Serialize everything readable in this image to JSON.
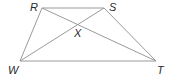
{
  "diagram": {
    "type": "trapezoid-with-diagonals",
    "vertices": [
      {
        "id": "R",
        "label": "R",
        "x": 42,
        "y": 8
      },
      {
        "id": "S",
        "label": "S",
        "x": 104,
        "y": 8
      },
      {
        "id": "T",
        "label": "T",
        "x": 156,
        "y": 61
      },
      {
        "id": "W",
        "label": "W",
        "x": 20,
        "y": 61
      }
    ],
    "intersection": {
      "id": "X",
      "label": "X",
      "x": 78,
      "y": 25
    },
    "edges": [
      [
        "R",
        "S"
      ],
      [
        "S",
        "T"
      ],
      [
        "T",
        "W"
      ],
      [
        "W",
        "R"
      ],
      [
        "R",
        "T"
      ],
      [
        "S",
        "W"
      ]
    ],
    "labels": {
      "R": "R",
      "S": "S",
      "X": "X",
      "W": "W",
      "T": "T"
    }
  }
}
